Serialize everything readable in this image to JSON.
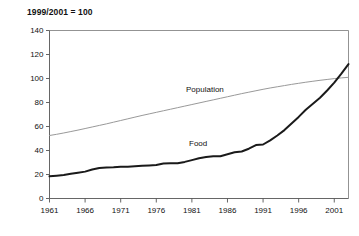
{
  "chart_data": {
    "type": "line",
    "title": "1999/2001 = 100",
    "xlabel": "",
    "ylabel": "",
    "xlim": [
      1961,
      2003
    ],
    "ylim": [
      0,
      140
    ],
    "yticks": [
      0,
      20,
      40,
      60,
      80,
      100,
      120,
      140
    ],
    "xticks": [
      1961,
      1966,
      1971,
      1976,
      1981,
      1986,
      1991,
      1996,
      2001
    ],
    "grid": false,
    "legend_position": "inline-annotation",
    "x": [
      1961,
      1962,
      1963,
      1964,
      1965,
      1966,
      1967,
      1968,
      1969,
      1970,
      1971,
      1972,
      1973,
      1974,
      1975,
      1976,
      1977,
      1978,
      1979,
      1980,
      1981,
      1982,
      1983,
      1984,
      1985,
      1986,
      1987,
      1988,
      1989,
      1990,
      1991,
      1992,
      1993,
      1994,
      1995,
      1996,
      1997,
      1998,
      1999,
      2000,
      2001,
      2002,
      2003
    ],
    "series": [
      {
        "name": "Population",
        "color": "#999999",
        "line_width": 1.0,
        "label_text": "Population",
        "values": [
          52.5,
          53.5,
          54.6,
          55.8,
          57.0,
          58.3,
          59.6,
          60.9,
          62.2,
          63.6,
          65.0,
          66.4,
          67.8,
          69.2,
          70.5,
          71.8,
          73.1,
          74.4,
          75.7,
          77.0,
          78.3,
          79.6,
          80.9,
          82.2,
          83.5,
          84.8,
          86.1,
          87.4,
          88.6,
          89.8,
          91.0,
          92.1,
          93.1,
          94.1,
          95.1,
          96.0,
          96.9,
          97.7,
          98.5,
          99.2,
          99.9,
          100.5,
          101.0
        ]
      },
      {
        "name": "Food",
        "color": "#1a1a1a",
        "line_width": 2.0,
        "label_text": "Food",
        "values": [
          18.5,
          19.0,
          19.6,
          20.6,
          21.5,
          22.4,
          24.2,
          25.5,
          25.8,
          26.0,
          26.5,
          26.4,
          26.8,
          27.3,
          27.6,
          28.0,
          29.2,
          29.4,
          29.3,
          30.5,
          32.0,
          33.5,
          34.5,
          35.3,
          35.2,
          36.8,
          38.5,
          39.2,
          41.5,
          44.5,
          45.0,
          48.5,
          52.5,
          57.0,
          62.5,
          68.0,
          74.0,
          79.0,
          84.0,
          90.0,
          96.5,
          104.0,
          112.0
        ]
      }
    ]
  },
  "annotations": {
    "population_label": "Population",
    "food_label": "Food"
  }
}
